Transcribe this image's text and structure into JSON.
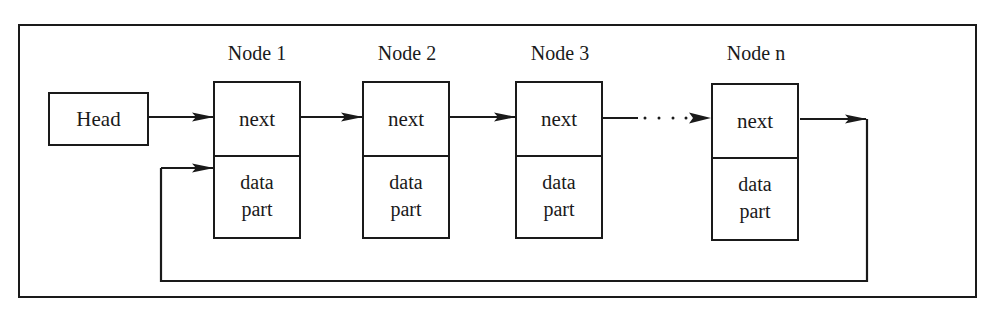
{
  "diagram": {
    "type": "circular-singly-linked-list",
    "head": {
      "label": "Head"
    },
    "nodes": [
      {
        "label": "Node 1",
        "next": "next",
        "data_line1": "data",
        "data_line2": "part"
      },
      {
        "label": "Node 2",
        "next": "next",
        "data_line1": "data",
        "data_line2": "part"
      },
      {
        "label": "Node 3",
        "next": "next",
        "data_line1": "data",
        "data_line2": "part"
      },
      {
        "label": "Node n",
        "next": "next",
        "data_line1": "data",
        "data_line2": "part"
      }
    ],
    "edges": [
      {
        "from": "Head",
        "to": "Node 1",
        "style": "solid"
      },
      {
        "from": "Node 1",
        "to": "Node 2",
        "style": "solid"
      },
      {
        "from": "Node 2",
        "to": "Node 3",
        "style": "solid"
      },
      {
        "from": "Node 3",
        "to": "Node n",
        "style": "dotted"
      },
      {
        "from": "Node n",
        "to": "Node 1",
        "style": "solid",
        "routing": "loop-back-below"
      }
    ],
    "colors": {
      "stroke": "#1a1a1a",
      "background": "#ffffff"
    }
  }
}
